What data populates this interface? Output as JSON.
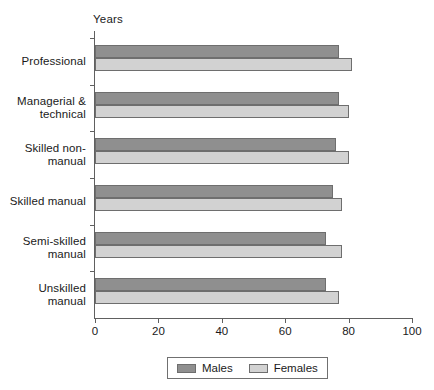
{
  "chart_data": {
    "type": "bar",
    "orientation": "horizontal",
    "title": "",
    "subtitle": "",
    "xlabel": "",
    "ylabel": "Years",
    "unit_label": "Years",
    "xlim": [
      0,
      100
    ],
    "xticks": [
      0,
      20,
      40,
      60,
      80,
      100
    ],
    "xtick_labels": [
      "0",
      "20",
      "40",
      "60",
      "80",
      "100"
    ],
    "grid": false,
    "legend_position": "bottom",
    "categories": [
      "Professional",
      "Managerial &\ntechnical",
      "Skilled non-\nmanual",
      "Skilled manual",
      "Semi-skilled\nmanual",
      "Unskilled\nmanual"
    ],
    "series": [
      {
        "name": "Males",
        "color": "#8f8f8f",
        "values": [
          77,
          77,
          76,
          75,
          73,
          73
        ]
      },
      {
        "name": "Females",
        "color": "#d2d2d2",
        "values": [
          81,
          80,
          80,
          78,
          78,
          77
        ]
      }
    ],
    "legend": [
      {
        "label": "Males",
        "color": "#8f8f8f"
      },
      {
        "label": "Females",
        "color": "#d2d2d2"
      }
    ]
  },
  "colors": {
    "males": "#8f8f8f",
    "females": "#d2d2d2",
    "axis": "#606060",
    "bar_outline": "#6e6e6e",
    "background": "#ffffff",
    "text": "#1a1a1a"
  }
}
